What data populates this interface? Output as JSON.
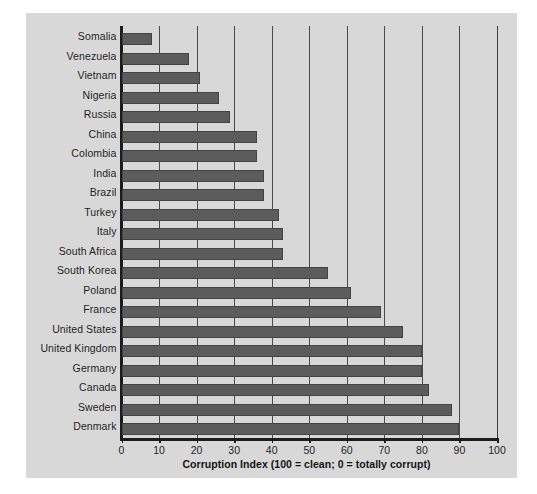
{
  "figure": {
    "background_color": "#d8d8d8",
    "page_background_color": "#ffffff",
    "bar_color": "#5c5c5c",
    "axis_color": "#1c1c1c",
    "gridline_color": "#4a4a4a"
  },
  "chart_data": {
    "type": "bar",
    "orientation": "horizontal",
    "title": "",
    "xlabel": "Corruption Index (100 = clean; 0 = totally corrupt)",
    "ylabel": "",
    "xlim": [
      0,
      100
    ],
    "xticks": [
      0,
      10,
      20,
      30,
      40,
      50,
      60,
      70,
      80,
      90,
      100
    ],
    "xtick_labels": [
      "0",
      "10",
      "20",
      "30",
      "40",
      "50",
      "60",
      "70",
      "80",
      "90",
      "100"
    ],
    "grid": "vertical",
    "legend": "none",
    "categories": [
      "Somalia",
      "Venezuela",
      "Vietnam",
      "Nigeria",
      "Russia",
      "China",
      "Colombia",
      "India",
      "Brazil",
      "Turkey",
      "Italy",
      "South Africa",
      "South Korea",
      "Poland",
      "France",
      "United States",
      "United Kingdom",
      "Germany",
      "Canada",
      "Sweden",
      "Denmark"
    ],
    "values": [
      8,
      18,
      21,
      26,
      29,
      36,
      36,
      38,
      38,
      42,
      43,
      43,
      55,
      61,
      69,
      75,
      80,
      80,
      82,
      88,
      90
    ]
  }
}
